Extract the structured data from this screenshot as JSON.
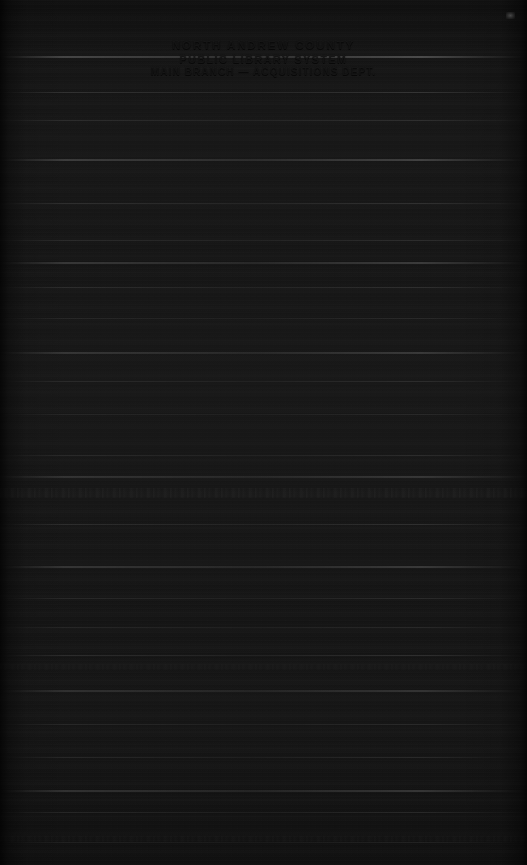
{
  "document": {
    "kind": "scanned-document",
    "condition": "severely underexposed / near-black scan with horizontal scan-line noise",
    "width": 527,
    "height": 865,
    "background_color": "#1e1e1e",
    "ink_color": "#969696"
  },
  "header": {
    "line1": "NORTH ANDREW COUNTY",
    "line2": "PUBLIC LIBRARY SYSTEM",
    "line3": "MAIN BRANCH — ACQUISITIONS DEPT."
  },
  "body": {
    "legible_text": "",
    "note": "No further text is legible in the scan."
  },
  "artifacts": {
    "streaks": [
      {
        "top": 56,
        "height": 2,
        "opacity": 0.55
      },
      {
        "top": 92,
        "height": 1,
        "opacity": 0.3
      },
      {
        "top": 120,
        "height": 1,
        "opacity": 0.22
      },
      {
        "top": 159,
        "height": 2,
        "opacity": 0.42
      },
      {
        "top": 203,
        "height": 1,
        "opacity": 0.26
      },
      {
        "top": 240,
        "height": 1,
        "opacity": 0.2
      },
      {
        "top": 262,
        "height": 2,
        "opacity": 0.38
      },
      {
        "top": 287,
        "height": 1,
        "opacity": 0.24
      },
      {
        "top": 318,
        "height": 1,
        "opacity": 0.18
      },
      {
        "top": 352,
        "height": 2,
        "opacity": 0.34
      },
      {
        "top": 381,
        "height": 1,
        "opacity": 0.22
      },
      {
        "top": 414,
        "height": 1,
        "opacity": 0.17
      },
      {
        "top": 455,
        "height": 1,
        "opacity": 0.2
      },
      {
        "top": 476,
        "height": 2,
        "opacity": 0.3
      },
      {
        "top": 524,
        "height": 1,
        "opacity": 0.24
      },
      {
        "top": 566,
        "height": 2,
        "opacity": 0.36
      },
      {
        "top": 598,
        "height": 1,
        "opacity": 0.2
      },
      {
        "top": 627,
        "height": 1,
        "opacity": 0.18
      },
      {
        "top": 655,
        "height": 1,
        "opacity": 0.26
      },
      {
        "top": 690,
        "height": 2,
        "opacity": 0.3
      },
      {
        "top": 724,
        "height": 1,
        "opacity": 0.19
      },
      {
        "top": 757,
        "height": 1,
        "opacity": 0.22
      },
      {
        "top": 790,
        "height": 2,
        "opacity": 0.34
      },
      {
        "top": 812,
        "height": 1,
        "opacity": 0.2
      },
      {
        "top": 842,
        "height": 1,
        "opacity": 0.16
      }
    ],
    "texture_bands": [
      {
        "top": 488,
        "height": 10,
        "opacity": 0.55
      },
      {
        "top": 664,
        "height": 6,
        "opacity": 0.32
      },
      {
        "top": 836,
        "height": 6,
        "opacity": 0.28
      }
    ],
    "speck": {
      "left": 506,
      "top": 12,
      "width": 9,
      "height": 7
    }
  }
}
